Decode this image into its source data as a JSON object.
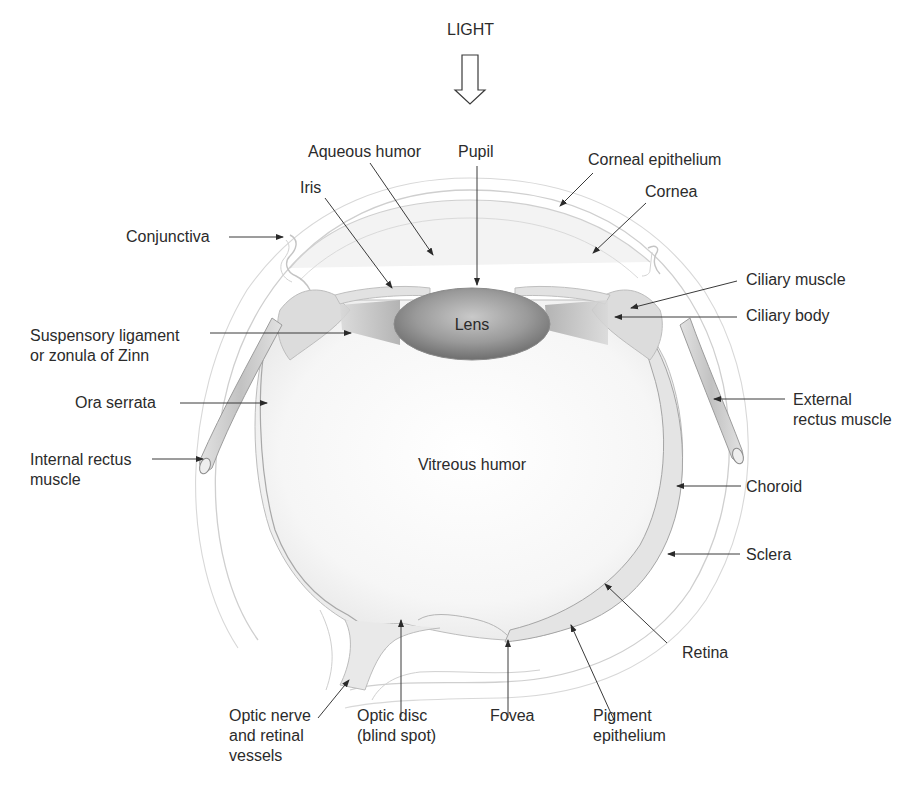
{
  "diagram": {
    "title": "LIGHT",
    "center_labels": {
      "lens": "Lens",
      "vitreous": "Vitreous humor"
    },
    "labels": [
      {
        "id": "aqueous-humor",
        "lines": [
          "Aqueous humor"
        ],
        "x": 308,
        "y": 142
      },
      {
        "id": "pupil",
        "lines": [
          "Pupil"
        ],
        "x": 458,
        "y": 142
      },
      {
        "id": "corneal-epithelium",
        "lines": [
          "Corneal epithelium"
        ],
        "x": 588,
        "y": 150
      },
      {
        "id": "iris",
        "lines": [
          "Iris"
        ],
        "x": 300,
        "y": 178
      },
      {
        "id": "cornea",
        "lines": [
          "Cornea"
        ],
        "x": 645,
        "y": 182
      },
      {
        "id": "conjunctiva",
        "lines": [
          "Conjunctiva"
        ],
        "x": 126,
        "y": 227
      },
      {
        "id": "ciliary-muscle",
        "lines": [
          "Ciliary muscle"
        ],
        "x": 746,
        "y": 270
      },
      {
        "id": "ciliary-body",
        "lines": [
          "Ciliary body"
        ],
        "x": 746,
        "y": 306
      },
      {
        "id": "suspensory-ligament",
        "lines": [
          "Suspensory ligament",
          "or zonula of Zinn"
        ],
        "x": 30,
        "y": 326
      },
      {
        "id": "ora-serrata",
        "lines": [
          "Ora serrata"
        ],
        "x": 75,
        "y": 393
      },
      {
        "id": "external-rectus-muscle",
        "lines": [
          "External",
          "rectus muscle"
        ],
        "x": 793,
        "y": 390
      },
      {
        "id": "internal-rectus-muscle",
        "lines": [
          "Internal rectus",
          "muscle"
        ],
        "x": 30,
        "y": 450
      },
      {
        "id": "choroid",
        "lines": [
          "Choroid"
        ],
        "x": 746,
        "y": 477
      },
      {
        "id": "sclera",
        "lines": [
          "Sclera"
        ],
        "x": 746,
        "y": 545
      },
      {
        "id": "retina",
        "lines": [
          "Retina"
        ],
        "x": 682,
        "y": 643
      },
      {
        "id": "optic-nerve",
        "lines": [
          "Optic nerve",
          "and retinal",
          "vessels"
        ],
        "x": 229,
        "y": 706
      },
      {
        "id": "optic-disc",
        "lines": [
          "Optic disc",
          "(blind spot)"
        ],
        "x": 357,
        "y": 706
      },
      {
        "id": "fovea",
        "lines": [
          "Fovea"
        ],
        "x": 490,
        "y": 706
      },
      {
        "id": "pigment-epithelium",
        "lines": [
          "Pigment",
          "epithelium"
        ],
        "x": 593,
        "y": 706
      }
    ],
    "leaders": [
      {
        "id": "aqueous-humor",
        "x1": 370,
        "y1": 163,
        "x2": 433,
        "y2": 255
      },
      {
        "id": "pupil",
        "x1": 477,
        "y1": 166,
        "x2": 477,
        "y2": 285
      },
      {
        "id": "corneal-epithelium",
        "x1": 593,
        "y1": 173,
        "x2": 560,
        "y2": 206
      },
      {
        "id": "iris",
        "x1": 325,
        "y1": 198,
        "x2": 392,
        "y2": 288
      },
      {
        "id": "cornea",
        "x1": 646,
        "y1": 203,
        "x2": 593,
        "y2": 253
      },
      {
        "id": "conjunctiva",
        "x1": 229,
        "y1": 237,
        "x2": 283,
        "y2": 237
      },
      {
        "id": "ciliary-muscle",
        "x1": 737,
        "y1": 281,
        "x2": 631,
        "y2": 308
      },
      {
        "id": "ciliary-body",
        "x1": 737,
        "y1": 317,
        "x2": 615,
        "y2": 317
      },
      {
        "id": "suspensory-ligament",
        "x1": 210,
        "y1": 333,
        "x2": 351,
        "y2": 333
      },
      {
        "id": "ora-serrata",
        "x1": 180,
        "y1": 403,
        "x2": 267,
        "y2": 403
      },
      {
        "id": "external-rectus-muscle",
        "x1": 785,
        "y1": 399,
        "x2": 714,
        "y2": 399
      },
      {
        "id": "internal-rectus-muscle",
        "x1": 152,
        "y1": 459,
        "x2": 203,
        "y2": 459
      },
      {
        "id": "choroid",
        "x1": 741,
        "y1": 486,
        "x2": 677,
        "y2": 486
      },
      {
        "id": "sclera",
        "x1": 740,
        "y1": 554,
        "x2": 668,
        "y2": 554
      },
      {
        "id": "retina",
        "x1": 667,
        "y1": 643,
        "x2": 605,
        "y2": 584
      },
      {
        "id": "optic-nerve",
        "x1": 318,
        "y1": 718,
        "x2": 349,
        "y2": 680
      },
      {
        "id": "optic-disc",
        "x1": 401,
        "y1": 717,
        "x2": 401,
        "y2": 620
      },
      {
        "id": "fovea",
        "x1": 508,
        "y1": 718,
        "x2": 508,
        "y2": 640
      },
      {
        "id": "pigment-epithelium",
        "x1": 614,
        "y1": 720,
        "x2": 571,
        "y2": 625
      }
    ],
    "colors": {
      "background": "#ffffff",
      "text": "#2b2b2b",
      "leader": "#3a3a3a",
      "outline": "#c8c8c8",
      "lens_dark": "#7a7a7a",
      "lens_light": "#bdbdbd",
      "tissue": "#e6e6e6"
    }
  }
}
